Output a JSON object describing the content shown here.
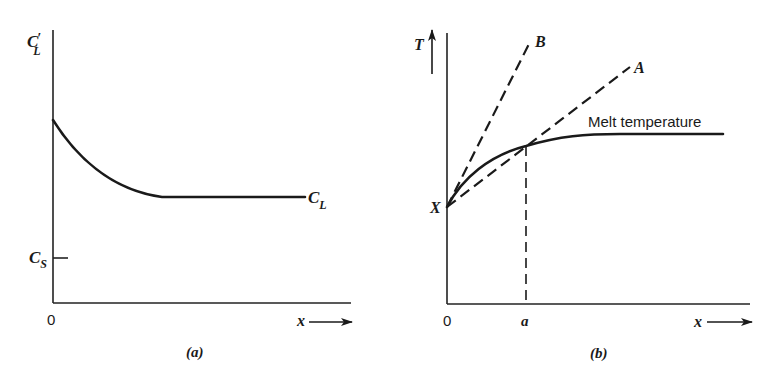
{
  "panels": [
    {
      "id": "a",
      "caption": "(a)",
      "y_axis_label_main": "C",
      "y_axis_label_sub": "L",
      "y_axis_label_prime": "′",
      "x_axis_label": "x",
      "origin_label": "0",
      "tick_label_main": "C",
      "tick_label_sub": "S",
      "curve_label_main": "C",
      "curve_label_sub": "L"
    },
    {
      "id": "b",
      "caption": "(b)",
      "y_axis_label": "T",
      "x_axis_label": "x",
      "origin_label": "0",
      "x_tick_label": "a",
      "start_point_label": "X",
      "line_labels": [
        "B",
        "A"
      ],
      "curve_label": "Melt temperature"
    }
  ],
  "colors": {
    "ink": "#1a1a1a",
    "background": "#ffffff"
  }
}
